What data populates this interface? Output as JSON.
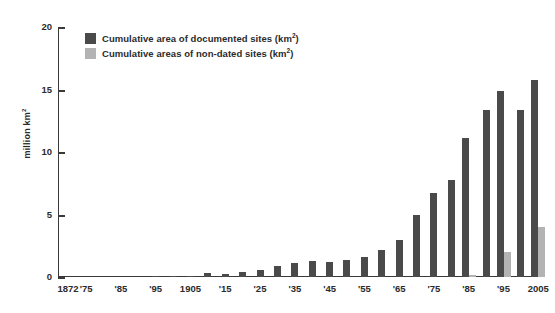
{
  "chart_data": {
    "type": "bar",
    "title": "",
    "subtitle": "",
    "xlabel": "",
    "ylabel": "million km²",
    "ylim": [
      0,
      20
    ],
    "yticks": [
      0,
      5,
      10,
      15,
      20
    ],
    "grid": false,
    "legend_position": "top-left",
    "categories": [
      "1872",
      "'75",
      "1880",
      "'85",
      "1890",
      "'95",
      "1900",
      "1905",
      "1910",
      "'15",
      "1920",
      "'25",
      "1930",
      "'35",
      "1940",
      "'45",
      "1950",
      "'55",
      "1960",
      "'65",
      "1970",
      "'75",
      "1980",
      "'85",
      "1990",
      "'95",
      "2000",
      "2005"
    ],
    "tick_labels": [
      "1872",
      "'75",
      "'85",
      "'95",
      "1905",
      "'15",
      "'25",
      "'35",
      "'45",
      "'55",
      "'65",
      "'75",
      "'85",
      "'95",
      "2005"
    ],
    "series": [
      {
        "name": "Cumulative area of documented sites (km²)",
        "color": "#4a4a4a",
        "values": [
          0,
          0,
          0,
          0,
          0,
          0.02,
          0.05,
          0.1,
          0.3,
          0.25,
          0.4,
          0.6,
          0.9,
          1.1,
          1.3,
          1.2,
          1.4,
          1.6,
          2.2,
          3.0,
          5.0,
          6.7,
          7.8,
          11.1,
          13.4,
          14.9,
          13.4,
          15.8
        ]
      },
      {
        "name": "Cumulative areas of non-dated sites (km²)",
        "color": "#b3b3b3",
        "values": [
          0,
          0,
          0,
          0,
          0,
          0,
          0,
          0,
          0,
          0,
          0,
          0,
          0,
          0,
          0,
          0,
          0,
          0,
          0,
          0,
          0,
          0,
          0,
          0.2,
          0,
          2.0,
          0,
          4.0
        ]
      }
    ]
  },
  "axis": {
    "y_label": "million km",
    "y_label_sup": "2",
    "y_ticks": [
      {
        "value": 20,
        "label": "20"
      },
      {
        "value": 15,
        "label": "15"
      },
      {
        "value": 10,
        "label": "10"
      },
      {
        "value": 5,
        "label": "5"
      },
      {
        "value": 0,
        "label": "0"
      }
    ],
    "x_ticks": [
      {
        "label": "1872",
        "pos": 0
      },
      {
        "label": "'75",
        "pos": 1
      },
      {
        "label": "'85",
        "pos": 3
      },
      {
        "label": "'95",
        "pos": 5
      },
      {
        "label": "1905",
        "pos": 7
      },
      {
        "label": "'15",
        "pos": 9
      },
      {
        "label": "'25",
        "pos": 11
      },
      {
        "label": "'35",
        "pos": 13
      },
      {
        "label": "'45",
        "pos": 15
      },
      {
        "label": "'55",
        "pos": 17
      },
      {
        "label": "'65",
        "pos": 19
      },
      {
        "label": "'75",
        "pos": 21
      },
      {
        "label": "'85",
        "pos": 23
      },
      {
        "label": "'95",
        "pos": 25
      },
      {
        "label": "2005",
        "pos": 27
      }
    ]
  },
  "legend": {
    "items": [
      {
        "label": "Cumulative area of documented sites (km",
        "sup": "2",
        "tail": ")",
        "color": "#4a4a4a"
      },
      {
        "label": "Cumulative areas of non-dated sites (km",
        "sup": "2",
        "tail": ")",
        "color": "#b3b3b3"
      }
    ]
  },
  "colors": {
    "dark_bar": "#4a4a4a",
    "light_bar": "#b3b3b3",
    "axis": "#3a3a3a",
    "text": "#2b2b2b",
    "background": "#ffffff"
  }
}
